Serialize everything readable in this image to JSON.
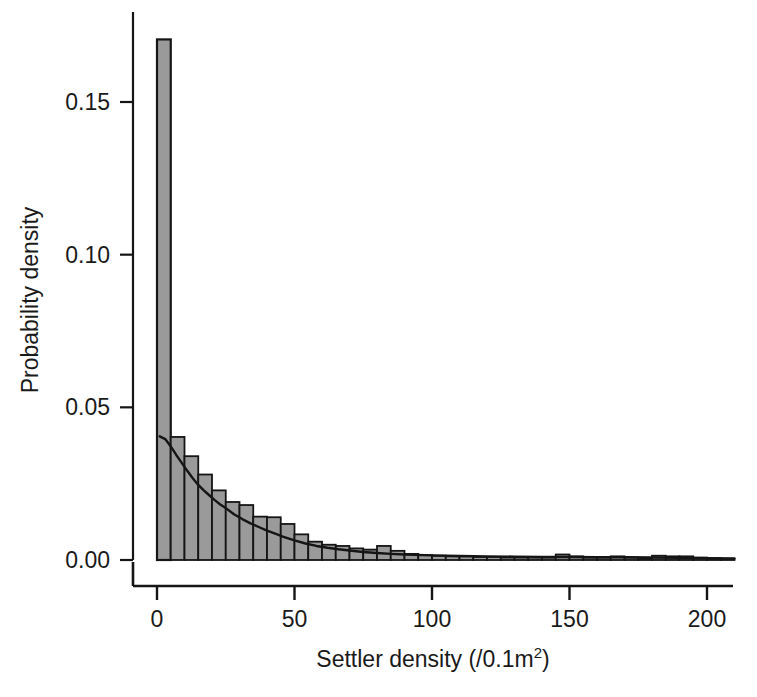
{
  "chart_data": {
    "type": "bar",
    "title": "",
    "subtitle": "",
    "xlabel": "Settler density (/0.1m2)",
    "xlabel_base": "Settler density (/0.1m",
    "xlabel_sup": "2",
    "xlabel_tail": ")",
    "ylabel": "Probability density",
    "xlim": [
      -2,
      211
    ],
    "ylim": [
      0.0,
      0.175
    ],
    "xticks": [
      0,
      50,
      100,
      150,
      200
    ],
    "xtick_labels": [
      "0",
      "50",
      "100",
      "150",
      "200"
    ],
    "yticks": [
      0.0,
      0.05,
      0.1,
      0.15
    ],
    "ytick_labels": [
      "0.00",
      "0.05",
      "0.10",
      "0.15"
    ],
    "grid": false,
    "legend": null,
    "bin_width": 5,
    "bin_starts": [
      0,
      5,
      10,
      15,
      20,
      25,
      30,
      35,
      40,
      45,
      50,
      55,
      60,
      65,
      70,
      75,
      80,
      85,
      90,
      95,
      100,
      105,
      110,
      115,
      120,
      125,
      130,
      135,
      140,
      145,
      150,
      155,
      160,
      165,
      170,
      175,
      180,
      185,
      190,
      195,
      200,
      205
    ],
    "values": [
      0.1705,
      0.0403,
      0.034,
      0.028,
      0.0228,
      0.019,
      0.018,
      0.0142,
      0.014,
      0.0118,
      0.0084,
      0.006,
      0.005,
      0.0046,
      0.0038,
      0.0034,
      0.0046,
      0.003,
      0.002,
      0.0016,
      0.0014,
      0.0012,
      0.0012,
      0.001,
      0.001,
      0.0008,
      0.0008,
      0.0008,
      0.0008,
      0.0018,
      0.0012,
      0.0008,
      0.0008,
      0.0012,
      0.0008,
      0.0006,
      0.0014,
      0.0012,
      0.0012,
      0.0008,
      0.0006,
      0.0004
    ],
    "curve": {
      "name": "fitted density curve",
      "x": [
        1,
        3,
        5,
        7,
        9,
        11,
        13,
        15,
        17,
        19,
        21,
        23,
        25,
        28,
        31,
        34,
        37,
        40,
        43,
        46,
        50,
        54,
        58,
        62,
        66,
        70,
        75,
        80,
        85,
        90,
        100,
        110,
        120,
        130,
        140,
        150,
        160,
        170,
        180,
        190,
        200,
        210
      ],
      "y": [
        0.0405,
        0.0396,
        0.0372,
        0.0344,
        0.0318,
        0.0292,
        0.0268,
        0.0246,
        0.0228,
        0.0212,
        0.0196,
        0.0182,
        0.017,
        0.015,
        0.0134,
        0.012,
        0.0108,
        0.0096,
        0.0086,
        0.0076,
        0.0064,
        0.0054,
        0.0046,
        0.004,
        0.0035,
        0.0031,
        0.0026,
        0.0023,
        0.002,
        0.0018,
        0.0015,
        0.0013,
        0.0012,
        0.0011,
        0.001,
        0.001,
        0.0009,
        0.0009,
        0.0008,
        0.0007,
        0.0006,
        0.0005
      ]
    },
    "style": {
      "bar_fill": "#9a9a9a",
      "bar_stroke": "#151515",
      "curve_color": "#151515",
      "axis_color": "#151515",
      "background": "#ffffff"
    }
  }
}
